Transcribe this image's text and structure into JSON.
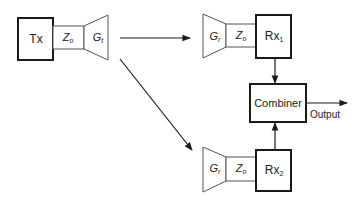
{
  "diagram": {
    "transmitter": {
      "box_label": "Tx",
      "impedance": {
        "symbol": "Z",
        "subscript": "o"
      },
      "antenna_gain": {
        "symbol": "G",
        "subscript": "t"
      }
    },
    "receivers": [
      {
        "box_label": "Rx",
        "box_subscript": "1",
        "antenna_gain": {
          "symbol": "G",
          "subscript": "r"
        },
        "impedance": {
          "symbol": "Z",
          "subscript": "o"
        }
      },
      {
        "box_label": "Rx",
        "box_subscript": "2",
        "antenna_gain": {
          "symbol": "G",
          "subscript": "r"
        },
        "impedance": {
          "symbol": "Z",
          "subscript": "o"
        }
      }
    ],
    "combiner": {
      "label": "Combiner"
    },
    "output": {
      "label": "Output"
    },
    "colors": {
      "stroke": "#1a1a1a",
      "light_stroke": "#555555",
      "background": "#ffffff"
    }
  }
}
